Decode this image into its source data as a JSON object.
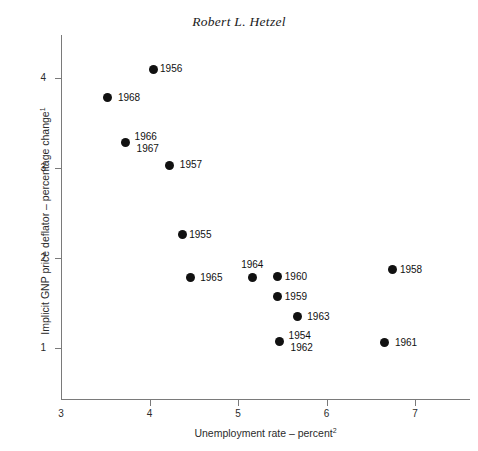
{
  "chart_data": {
    "type": "scatter",
    "title": "Robert L. Hetzel",
    "xlabel": "Unemployment rate – percent",
    "xlabel_superscript": "2",
    "ylabel": "Implicit GNP price deflator – percentage change",
    "ylabel_superscript": "1",
    "xlim": [
      2.72,
      7.34
    ],
    "ylim": [
      0.44,
      4.58
    ],
    "xticks": [
      3,
      4,
      5,
      6,
      7
    ],
    "xtick_labels": [
      "3",
      "4",
      "5",
      "6",
      "7"
    ],
    "yticks": [
      1,
      2,
      3,
      4
    ],
    "ytick_labels": [
      "1",
      "2",
      "3",
      "4"
    ],
    "grid": false,
    "legend": false,
    "marker_color": "#111111",
    "axis_color": "#7a7a7a",
    "background": "#ffffff",
    "points": [
      {
        "label": "1956",
        "x": 4.04,
        "y": 4.1,
        "label_pos": "right"
      },
      {
        "label": "1968",
        "x": 3.53,
        "y": 3.78,
        "label_pos": "right-gap"
      },
      {
        "label": "1966",
        "x": 3.73,
        "y": 3.28,
        "label_pos": "stack-upper"
      },
      {
        "label": "1967",
        "x": 3.73,
        "y": 3.28,
        "label_pos": "stack-lower"
      },
      {
        "label": "1957",
        "x": 4.23,
        "y": 3.03,
        "label_pos": "right-gap"
      },
      {
        "label": "1955",
        "x": 4.37,
        "y": 2.26,
        "label_pos": "right"
      },
      {
        "label": "1965",
        "x": 4.46,
        "y": 1.78,
        "label_pos": "right-gap"
      },
      {
        "label": "1964",
        "x": 5.16,
        "y": 1.78,
        "label_pos": "above"
      },
      {
        "label": "1960",
        "x": 5.45,
        "y": 1.79,
        "label_pos": "right"
      },
      {
        "label": "1959",
        "x": 5.45,
        "y": 1.57,
        "label_pos": "right"
      },
      {
        "label": "1963",
        "x": 5.67,
        "y": 1.35,
        "label_pos": "right-gap"
      },
      {
        "label": "1954",
        "x": 5.47,
        "y": 1.07,
        "label_pos": "stack-upper"
      },
      {
        "label": "1962",
        "x": 5.47,
        "y": 1.07,
        "label_pos": "stack-lower"
      },
      {
        "label": "1958",
        "x": 6.75,
        "y": 1.87,
        "label_pos": "right"
      },
      {
        "label": "1961",
        "x": 6.66,
        "y": 1.06,
        "label_pos": "right-gap"
      }
    ]
  }
}
